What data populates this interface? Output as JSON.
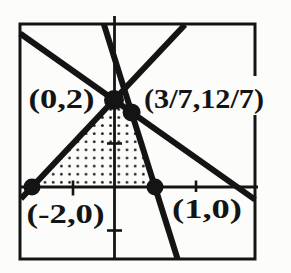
{
  "figure": {
    "background": "#fcfcfa",
    "ink": "#141414",
    "stipple_dot_color": "#1c1c1c"
  },
  "chart_data": {
    "type": "line",
    "title": "",
    "xlabel": "",
    "ylabel": "",
    "grid": false,
    "xlim": [
      -2.3,
      3.44
    ],
    "ylim": [
      -1.66,
      3.75
    ],
    "x_ticks": [
      -1,
      2
    ],
    "y_ticks": [
      1,
      -1
    ],
    "series": [
      {
        "name": "y = x + 2",
        "points": [
          [
            -2.27,
            -0.27
          ],
          [
            1.73,
            3.73
          ]
        ]
      },
      {
        "name": "y = -3x + 3",
        "points": [
          [
            -0.25,
            3.75
          ],
          [
            1.55,
            -1.65
          ]
        ]
      },
      {
        "name": "y = -(2/3)x + 2",
        "points": [
          [
            -2.29,
            3.53
          ],
          [
            3.44,
            -0.29
          ]
        ]
      }
    ],
    "vertices": [
      {
        "label": "(-2,0)",
        "x": -2,
        "y": 0
      },
      {
        "label": "(0,2)",
        "x": 0,
        "y": 2
      },
      {
        "label": "(3/7,12/7)",
        "x": 0.4286,
        "y": 1.7143
      },
      {
        "label": "(1,0)",
        "x": 1,
        "y": 0
      }
    ],
    "shaded_region": {
      "style": "stipple-dots",
      "vertices": [
        [
          -2,
          0
        ],
        [
          0,
          2
        ],
        [
          0.4286,
          1.7143
        ],
        [
          1,
          0
        ]
      ]
    }
  },
  "layout": {
    "origin_px": [
      114,
      187
    ],
    "px_per_unit": [
      41,
      43.5
    ],
    "frame_px": [
      20,
      24,
      235,
      235
    ],
    "x_axis_px": {
      "y": 187,
      "x1": 19,
      "x2": 258
    },
    "y_axis_px": {
      "x": 114.5,
      "y1": 16,
      "y2": 259
    },
    "stroke": {
      "frame": 3,
      "axis": 2.8,
      "line": 6,
      "tick": 2.6
    },
    "tick_half": 7.5,
    "dot_r": [
      8.5,
      10,
      9,
      8.5
    ],
    "label_font": 27,
    "point_labels": [
      {
        "vertex": 0,
        "rect": [
          23,
          196,
          85,
          33
        ],
        "baseline": 223,
        "textLength": 78
      },
      {
        "vertex": 1,
        "rect": [
          23,
          86,
          77,
          28
        ],
        "baseline": 108,
        "textLength": 66
      },
      {
        "vertex": 2,
        "rect": [
          141,
          76,
          126,
          39
        ],
        "baseline": 108,
        "textLength": 120
      },
      {
        "vertex": 3,
        "rect": [
          165,
          192,
          84,
          32
        ],
        "baseline": 218,
        "textLength": 70
      }
    ]
  }
}
